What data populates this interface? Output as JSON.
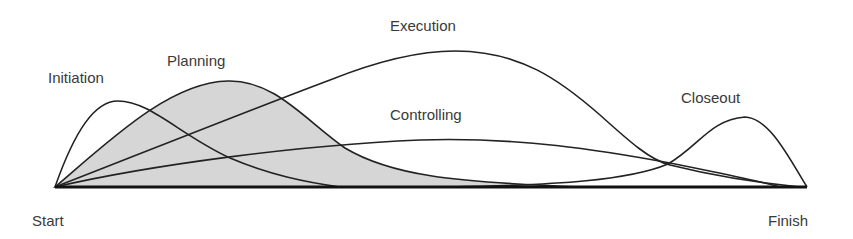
{
  "diagram": {
    "colors": {
      "background": "#ffffff",
      "line": "#222222",
      "planning_fill": "#d6d6d6",
      "label": "#3a3a3a"
    },
    "axis": {
      "start_label": "Start",
      "finish_label": "Finish"
    },
    "phases": [
      {
        "id": "initiation",
        "label": "Initiation",
        "shaded": false
      },
      {
        "id": "planning",
        "label": "Planning",
        "shaded": true
      },
      {
        "id": "execution",
        "label": "Execution",
        "shaded": false
      },
      {
        "id": "controlling",
        "label": "Controlling",
        "shaded": false
      },
      {
        "id": "closeout",
        "label": "Closeout",
        "shaded": false
      }
    ]
  }
}
